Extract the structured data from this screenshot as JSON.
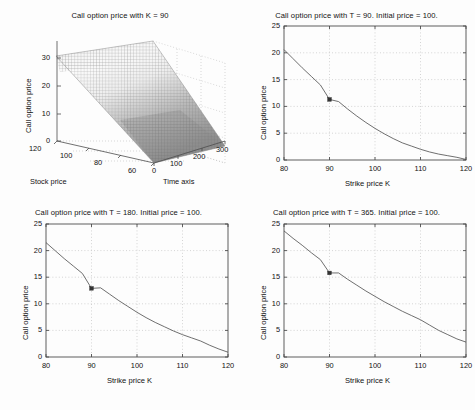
{
  "figure": {
    "background": "#fdfdfd",
    "line_color": "#555555",
    "grid_color": "#b8b8b8",
    "axis_color": "#4d4d4d",
    "marker_color": "#333333"
  },
  "chart_data": [
    {
      "id": "surface-K90",
      "type": "surface",
      "title": "Call option price with K = 90",
      "xlabel": "Stock price",
      "ylabel": "Time axis",
      "zlabel": "Call option price",
      "xticks": [
        120,
        100,
        80,
        60
      ],
      "yticks": [
        0,
        100,
        200,
        300
      ],
      "zticks": [
        0,
        10,
        20,
        30
      ],
      "xlim": [
        60,
        120
      ],
      "ylim": [
        0,
        300
      ],
      "zlim": [
        0,
        35
      ],
      "grid": true,
      "mesh": "dense grey wireframe surface, light at top-left ridge darkening toward lower-right",
      "description": "Call option value surface versus stock price and time to maturity; price rises to about 32 at stock price 120 and decays toward 0 at low stock price / short time."
    },
    {
      "id": "T90",
      "type": "line",
      "title": "Call option price with T = 90.  Initial price = 100.",
      "xlabel": "Strike price K",
      "ylabel": "Call option price",
      "xticks": [
        80,
        90,
        100,
        110,
        120
      ],
      "yticks": [
        0,
        5,
        10,
        15,
        20,
        25
      ],
      "xlim": [
        80,
        120
      ],
      "ylim": [
        0,
        25
      ],
      "grid": true,
      "x": [
        80,
        82,
        84,
        86,
        88,
        90,
        92,
        94,
        96,
        98,
        100,
        102,
        104,
        106,
        108,
        110,
        112,
        114,
        116,
        118,
        120
      ],
      "values": [
        20.6,
        18.9,
        17.2,
        15.6,
        14.0,
        11.3,
        10.9,
        9.5,
        8.2,
        7.0,
        5.9,
        4.9,
        4.0,
        3.2,
        2.6,
        2.0,
        1.5,
        1.1,
        0.8,
        0.5,
        0.1
      ],
      "markers": [
        {
          "x": 90,
          "y": 11.3,
          "label": "K = 90"
        }
      ]
    },
    {
      "id": "T180",
      "type": "line",
      "title": "Call option price with T = 180.  Initial price = 100.",
      "xlabel": "Strike price K",
      "ylabel": "Call option price",
      "xticks": [
        80,
        90,
        100,
        110,
        120
      ],
      "yticks": [
        0,
        5,
        10,
        15,
        20,
        25
      ],
      "xlim": [
        80,
        120
      ],
      "ylim": [
        0,
        25
      ],
      "grid": true,
      "x": [
        80,
        82,
        84,
        86,
        88,
        90,
        92,
        94,
        96,
        98,
        100,
        102,
        104,
        106,
        108,
        110,
        112,
        114,
        116,
        118,
        120
      ],
      "values": [
        21.5,
        20.0,
        18.5,
        17.1,
        15.7,
        12.9,
        13.0,
        11.8,
        10.6,
        9.5,
        8.4,
        7.4,
        6.5,
        5.7,
        4.9,
        4.2,
        3.6,
        3.0,
        2.2,
        1.5,
        0.9
      ],
      "markers": [
        {
          "x": 90,
          "y": 12.9,
          "label": "K = 90"
        }
      ]
    },
    {
      "id": "T365",
      "type": "line",
      "title": "Call option price with T = 365.  Initial price = 100.",
      "xlabel": "Strike price K",
      "ylabel": "Call option price",
      "xticks": [
        80,
        90,
        100,
        110,
        120
      ],
      "yticks": [
        0,
        5,
        10,
        15,
        20,
        25
      ],
      "xlim": [
        80,
        120
      ],
      "ylim": [
        0,
        25
      ],
      "grid": true,
      "x": [
        80,
        82,
        84,
        86,
        88,
        90,
        92,
        94,
        96,
        98,
        100,
        102,
        104,
        106,
        108,
        110,
        112,
        114,
        116,
        118,
        120
      ],
      "values": [
        23.7,
        22.3,
        21.0,
        19.6,
        18.3,
        15.8,
        15.8,
        14.6,
        13.5,
        12.4,
        11.4,
        10.4,
        9.5,
        8.6,
        7.8,
        7.0,
        6.0,
        5.0,
        4.2,
        3.4,
        2.8
      ],
      "markers": [
        {
          "x": 90,
          "y": 15.8,
          "label": "K = 90"
        }
      ]
    }
  ]
}
